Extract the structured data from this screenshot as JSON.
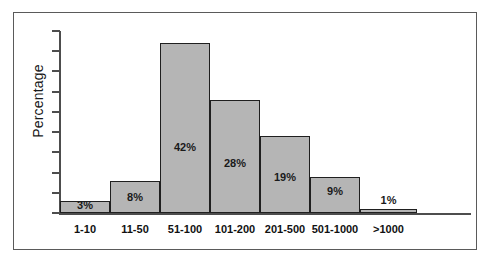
{
  "figure": {
    "y_axis_title": "Percentage",
    "bar_fill_color": "#b5b5b5",
    "bar_border_color": "#1f1f1f",
    "axis_color": "#4d4d4d"
  },
  "chart_data": {
    "type": "bar",
    "title": "",
    "subtitle": "",
    "xlabel": "",
    "ylabel": "Percentage",
    "categories": [
      "1-10",
      "11-50",
      "51-100",
      "101-200",
      "201-500",
      "501-1000",
      ">1000"
    ],
    "values": [
      3,
      8,
      42,
      28,
      19,
      9,
      1
    ],
    "data_labels": [
      "3%",
      "8%",
      "42%",
      "28%",
      "19%",
      "9%",
      "1%"
    ],
    "ylim": [
      0,
      45
    ],
    "ytick_values": [
      0,
      5,
      10,
      15,
      20,
      25,
      30,
      35,
      40,
      45
    ],
    "ytick_labels": [
      "",
      "",
      "",
      "",
      "",
      "",
      "",
      "",
      "",
      ""
    ],
    "grid": false,
    "legend": null,
    "legend_position": "none",
    "annotations": [
      "Data labels are drawn inside each bar except >1000 which is drawn above the bar"
    ]
  }
}
